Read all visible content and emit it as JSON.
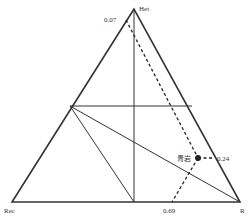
{
  "diagram": {
    "type": "ternary",
    "vertices": {
      "top": {
        "label": "Het",
        "x": 134,
        "y": 9
      },
      "left": {
        "label": "Rec",
        "x": 12,
        "y": 202
      },
      "right": {
        "label": "R",
        "x": 240,
        "y": 202
      }
    },
    "annotations": {
      "top_left_value": "0.07",
      "bottom_value": "0.69",
      "point_label": "青岩",
      "point_value": "0.24"
    },
    "point": {
      "x": 198,
      "y": 158
    },
    "colors": {
      "lines": "#333333",
      "point": "#222222",
      "background": "#ffffff"
    }
  }
}
